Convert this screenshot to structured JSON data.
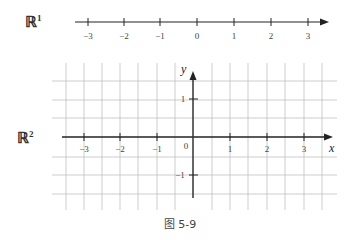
{
  "figure": {
    "caption": "图 5-9",
    "r1": {
      "label": "ℝ",
      "superscript": "1",
      "ticks": [
        "−3",
        "−2",
        "−1",
        "0",
        "1",
        "2",
        "3"
      ]
    },
    "r2": {
      "label": "ℝ",
      "superscript": "2",
      "x_ticks": [
        "−3",
        "−2",
        "−1",
        "1",
        "2",
        "3"
      ],
      "origin_label": "0",
      "y_ticks": [
        "1",
        "−1"
      ],
      "x_axis_name": "x",
      "y_axis_name": "y",
      "grid_step": 0.5
    }
  },
  "colors": {
    "axis": "#222222",
    "grid": "#b5b5b5",
    "text": "#333333"
  }
}
